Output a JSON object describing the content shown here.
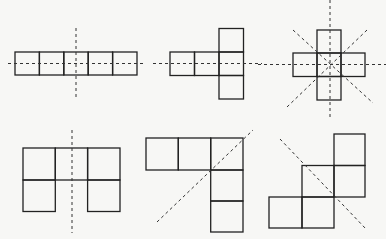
{
  "diagram": {
    "colors": {
      "background": "#f7f7f5",
      "square_stroke": "#222222",
      "axis_stroke": "#333333"
    },
    "figures": [
      {
        "id": 1,
        "label": "five squares in a row",
        "squares": [
          [
            15,
            52,
            24.4,
            23
          ],
          [
            39.4,
            52,
            24.4,
            23
          ],
          [
            63.8,
            52,
            24.4,
            23
          ],
          [
            88.2,
            52,
            24.4,
            23
          ],
          [
            112.6,
            52,
            24.4,
            23
          ]
        ],
        "axes": [
          [
            8,
            63.5,
            145,
            63.5
          ],
          [
            76,
            28,
            76,
            97
          ]
        ]
      },
      {
        "id": 2,
        "label": "T-shape (row of three with column through right end)",
        "squares": [
          [
            170,
            52,
            24.5,
            23.5
          ],
          [
            194.5,
            52,
            24.5,
            23.5
          ],
          [
            219,
            52,
            24.5,
            23.5
          ],
          [
            219,
            28.5,
            24.5,
            23.5
          ],
          [
            219,
            75.5,
            24.5,
            23.5
          ]
        ],
        "axes": [
          [
            153,
            63.5,
            262,
            63.5
          ]
        ]
      },
      {
        "id": 3,
        "label": "plus / cross shape",
        "squares": [
          [
            317,
            30,
            24,
            23
          ],
          [
            293,
            53,
            24,
            23.5
          ],
          [
            317,
            53,
            24,
            23.5
          ],
          [
            341,
            53,
            24,
            23.5
          ],
          [
            317,
            76.5,
            24,
            23.5
          ]
        ],
        "axes": [
          [
            258,
            64.5,
            386,
            64.5
          ],
          [
            330,
            0,
            330,
            119
          ],
          [
            293,
            30,
            373,
            103
          ],
          [
            367,
            30,
            287,
            107
          ]
        ]
      },
      {
        "id": 4,
        "label": "U-shape (top row of three, two legs)",
        "squares": [
          [
            23,
            148,
            32.3,
            32
          ],
          [
            55.3,
            148,
            32.3,
            32
          ],
          [
            87.6,
            148,
            32.4,
            32
          ],
          [
            23,
            180,
            32.3,
            31.5
          ],
          [
            87.6,
            180,
            32.4,
            31.5
          ]
        ],
        "axes": [
          [
            72,
            130,
            72,
            233
          ]
        ]
      },
      {
        "id": 5,
        "label": "L-shape (row of three, column of three sharing corner)",
        "squares": [
          [
            146,
            138,
            32.3,
            32
          ],
          [
            178.3,
            138,
            32.4,
            32
          ],
          [
            210.7,
            138,
            32.3,
            32
          ],
          [
            210.7,
            170,
            32.3,
            31
          ],
          [
            210.7,
            201,
            32.3,
            31
          ]
        ],
        "axes": [
          [
            157,
            222,
            253,
            130
          ]
        ]
      },
      {
        "id": 6,
        "label": "staircase shape",
        "squares": [
          [
            334,
            134,
            31,
            31.5
          ],
          [
            302,
            165.5,
            32,
            31.5
          ],
          [
            334,
            165.5,
            31,
            31.5
          ],
          [
            269,
            197,
            33,
            31
          ],
          [
            302,
            197,
            32,
            31
          ]
        ],
        "axes": [
          [
            280,
            139,
            366,
            229
          ]
        ]
      }
    ]
  }
}
